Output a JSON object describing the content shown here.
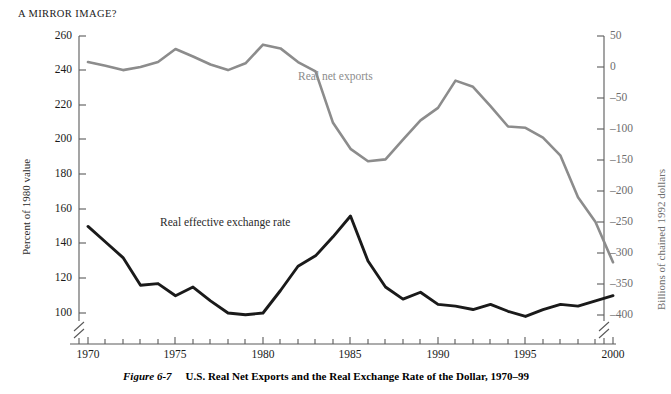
{
  "box_title": "A MIRROR IMAGE?",
  "caption": {
    "figure_number": "Figure 6-7",
    "text": "U.S. Real Net Exports and the Real Exchange Rate of the Dollar, 1970–99"
  },
  "colors": {
    "net_exports_line": "#8c8c8c",
    "exchange_rate_line": "#1a1a1a",
    "axis": "#5a5a5a",
    "right_axis_text": "#6e6e6e",
    "left_axis_text": "#1a1a1a",
    "background": "#ffffff"
  },
  "chart_data": {
    "type": "line",
    "title": "A MIRROR IMAGE?",
    "xlabel": "",
    "ylabel": "Percent of 1980 value",
    "y2label": "Billions of chained 1992 dollars",
    "grid": false,
    "legend_position": "inline-annotations",
    "x": [
      1970,
      1971,
      1972,
      1973,
      1974,
      1975,
      1976,
      1977,
      1978,
      1979,
      1980,
      1981,
      1982,
      1983,
      1984,
      1985,
      1986,
      1987,
      1988,
      1989,
      1990,
      1991,
      1992,
      1993,
      1994,
      1995,
      1996,
      1997,
      1998,
      1999,
      2000
    ],
    "xlim": [
      1970,
      2000
    ],
    "xticks": [
      1970,
      1975,
      1980,
      1985,
      1990,
      1995,
      2000
    ],
    "xticklabels": [
      "1970",
      "1975",
      "1980",
      "1985",
      "1990",
      "1995",
      "2000"
    ],
    "xtick_minor_step": 1,
    "x_axis_break": true,
    "ylim": [
      96,
      260
    ],
    "yticks": [
      100,
      120,
      140,
      160,
      180,
      200,
      220,
      240,
      260
    ],
    "yticklabels": [
      "100",
      "120",
      "140",
      "160",
      "180",
      "200",
      "220",
      "240",
      "260"
    ],
    "y_axis_break": true,
    "y2lim": [
      -412,
      50
    ],
    "y2ticks": [
      50,
      0,
      -50,
      -100,
      -150,
      -200,
      -250,
      -300,
      -350,
      -400
    ],
    "y2ticklabels": [
      "50",
      "0",
      "–50",
      "–100",
      "–150",
      "–200",
      "–250",
      "–300",
      "–350",
      "–400"
    ],
    "y2_axis_break": true,
    "series": [
      {
        "name": "Real net exports",
        "axis": "right",
        "units": "Billions of chained 1992 dollars",
        "color": "#8c8c8c",
        "label_text": "Real net exports",
        "values": [
          8,
          2,
          -5,
          0,
          8,
          29,
          17,
          4,
          -5,
          6,
          36,
          30,
          8,
          -7,
          -90,
          -132,
          -152,
          -149,
          -117,
          -86,
          -66,
          -22,
          -32,
          -63,
          -96,
          -98,
          -114,
          -143,
          -210,
          -250,
          -315
        ],
        "values_percent_axis_equiv": [
          219,
          215,
          210,
          213,
          218,
          240,
          232,
          223,
          217,
          224,
          246,
          243,
          231,
          219,
          190,
          184,
          183,
          185,
          200,
          214,
          225,
          235,
          230,
          214,
          203,
          202,
          198,
          186,
          168,
          152,
          126
        ]
      },
      {
        "name": "Real effective exchange rate",
        "axis": "left",
        "units": "Percent of 1980 value",
        "color": "#1a1a1a",
        "label_text": "Real effective exchange rate",
        "values": [
          150,
          141,
          132,
          116,
          117,
          110,
          115,
          107,
          100,
          99,
          100,
          113,
          127,
          133,
          144,
          156,
          130,
          115,
          108,
          112,
          105,
          104,
          102,
          105,
          101,
          98,
          102,
          105,
          104,
          107,
          110
        ]
      }
    ]
  },
  "annotations": {
    "net_exports_label": "Real net exports",
    "exchange_rate_label": "Real effective exchange rate"
  }
}
